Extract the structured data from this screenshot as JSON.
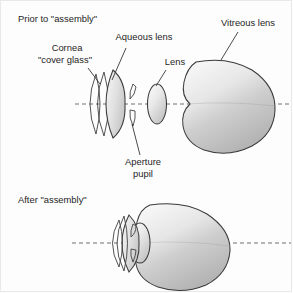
{
  "figure": {
    "title_top": "Prior to \"assembly\"",
    "title_bottom": "After \"assembly\"",
    "labels": {
      "cornea_line1": "Cornea",
      "cornea_line2": "\"cover glass\"",
      "aqueous": "Aqueous lens",
      "lens": "Lens",
      "vitreous": "Vitreous lens",
      "aperture_line1": "Aperture",
      "aperture_line2": "pupil"
    },
    "colors": {
      "background": "#fdfdfd",
      "outline": "#3a3a3a",
      "axis": "#6e6e6e",
      "text": "#1d1d1d",
      "fill_light": "#f2f2f2",
      "fill_mid": "#d6d6d6",
      "fill_dark": "#b9b9b9"
    },
    "parts": [
      {
        "name": "cornea",
        "shape": "crescent-arc-pair"
      },
      {
        "name": "aqueous-lens",
        "shape": "filled-crescent"
      },
      {
        "name": "aperture-pupil",
        "shape": "twin-slivers"
      },
      {
        "name": "lens",
        "shape": "ellipse"
      },
      {
        "name": "vitreous-lens",
        "shape": "rounded-blob"
      }
    ]
  }
}
